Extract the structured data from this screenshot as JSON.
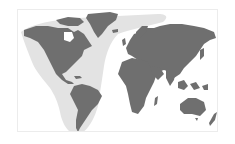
{
  "map": {
    "type": "world-map",
    "projection": "robinson-like",
    "colors": {
      "background": "#ffffff",
      "land": "#6f6f6f",
      "highlight_region": "#e3e3e3",
      "border": "#ececec"
    },
    "highlighted_region": {
      "name": "Americas and Atlantic",
      "covers": [
        "North America",
        "Central America",
        "South America",
        "Greenland",
        "North Atlantic"
      ]
    },
    "continents": [
      "North America",
      "South America",
      "Greenland",
      "Europe",
      "Africa",
      "Asia",
      "Australia",
      "New Zealand"
    ]
  }
}
